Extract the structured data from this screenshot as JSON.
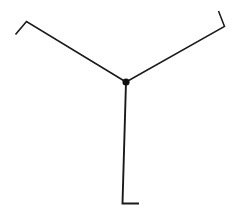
{
  "figure": {
    "kind": "line-diagram",
    "width": 240,
    "height": 213,
    "background_color": "#ffffff",
    "stroke_color": "#1a1a1a",
    "stroke_width": 1.6,
    "junction": {
      "label": "center-node",
      "x": 126,
      "y": 82,
      "radius": 3.6,
      "fill_color": "#111111"
    },
    "branches": [
      {
        "name": "upper-left-branch",
        "label": "Upper left arm",
        "stroke_width": 1.6,
        "points": [
          [
            126,
            82
          ],
          [
            26.5,
            21.5
          ],
          [
            15.5,
            34.5
          ]
        ]
      },
      {
        "name": "upper-right-branch",
        "label": "Upper right arm",
        "stroke_width": 1.5,
        "points": [
          [
            126,
            82
          ],
          [
            224.5,
            26.5
          ],
          [
            218.5,
            11.0
          ]
        ]
      },
      {
        "name": "lower-branch",
        "label": "Lower vertical arm",
        "stroke_width": 1.9,
        "points": [
          [
            126,
            82
          ],
          [
            122.5,
            203.5
          ],
          [
            139.0,
            203.5
          ]
        ]
      }
    ]
  }
}
